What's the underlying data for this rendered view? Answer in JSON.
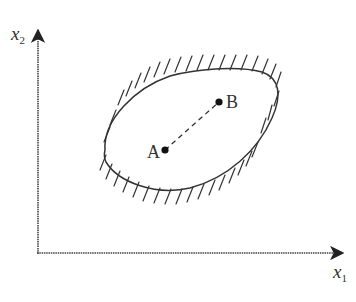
{
  "diagram": {
    "colors": {
      "stroke": "#333333",
      "background": "#ffffff"
    },
    "axes": {
      "x": {
        "var": "x",
        "sub": "1"
      },
      "y": {
        "var": "x",
        "sub": "2"
      }
    },
    "region": {
      "description": "closed convex region with outward hatching on boundary"
    },
    "points": [
      {
        "id": "A",
        "label": "A"
      },
      {
        "id": "B",
        "label": "B"
      }
    ],
    "segment": {
      "from": "A",
      "to": "B",
      "style": "dashed"
    }
  }
}
